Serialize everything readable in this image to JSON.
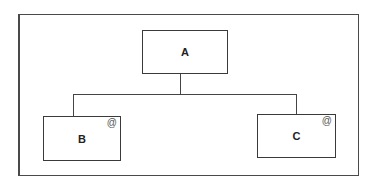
{
  "diagram": {
    "type": "hierarchy",
    "nodes": [
      {
        "id": "A",
        "label": "A",
        "marker": ""
      },
      {
        "id": "B",
        "label": "B",
        "marker": "@"
      },
      {
        "id": "C",
        "label": "C",
        "marker": "@"
      }
    ],
    "edges": [
      {
        "from": "A",
        "to": "B"
      },
      {
        "from": "A",
        "to": "C"
      }
    ],
    "colors": {
      "line": "#444444",
      "background": "#ffffff"
    }
  }
}
